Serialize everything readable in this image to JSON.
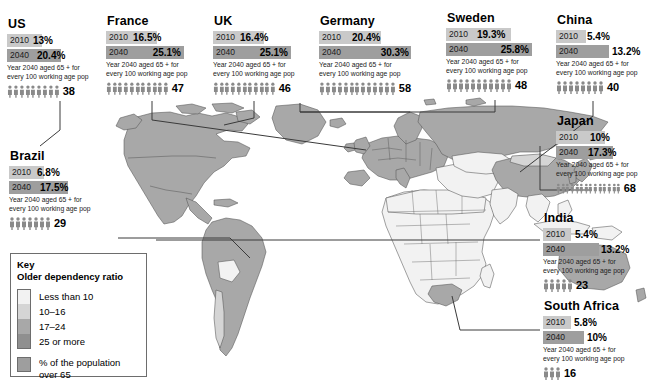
{
  "legend": {
    "title_line1": "Key",
    "title_line2": "Older dependency ratio",
    "scale": [
      {
        "label": "Less than 10",
        "color": "#f2f2f2"
      },
      {
        "label": "10–16",
        "color": "#d5d5d5"
      },
      {
        "label": "17–24",
        "color": "#a8a8a8"
      },
      {
        "label": "25 or more",
        "color": "#8f8f8f"
      }
    ],
    "population_swatch_label_line1": "% of the population",
    "population_swatch_label_line2": "over 65",
    "population_swatch_color": "#9e9e9e"
  },
  "note_line1": "Year 2040 aged 65 + for",
  "note_line2": "every 100 working age pop",
  "year_2010_label": "2010",
  "year_2040_label": "2040",
  "colors": {
    "bar_2010": "#c9c9c9",
    "bar_2040": "#9e9e9e",
    "map_light": "#f2f2f2",
    "map_mid": "#d5d5d5",
    "map_dark": "#a8a8a8",
    "outline": "#555555"
  },
  "countries": [
    {
      "id": "us",
      "name": "US",
      "v2010": "13%",
      "v2040": "20.4%",
      "bar2010_pct": 52,
      "bar2040_pct": 80,
      "dependency": "38",
      "icons": 9
    },
    {
      "id": "france",
      "name": "France",
      "v2010": "16.5%",
      "v2040": "25.1%",
      "bar2010_pct": 66,
      "bar2040_pct": 100,
      "dependency": "47",
      "icons": 11
    },
    {
      "id": "uk",
      "name": "UK",
      "v2010": "16.4%",
      "v2040": "25.1%",
      "bar2010_pct": 65,
      "bar2040_pct": 100,
      "dependency": "46",
      "icons": 11
    },
    {
      "id": "germany",
      "name": "Germany",
      "v2010": "20.4%",
      "v2040": "30.3%",
      "bar2010_pct": 67,
      "bar2040_pct": 100,
      "dependency": "58",
      "icons": 13
    },
    {
      "id": "sweden",
      "name": "Sweden",
      "v2010": "19.3%",
      "v2040": "25.8%",
      "bar2010_pct": 75,
      "bar2040_pct": 100,
      "dependency": "48",
      "icons": 11
    },
    {
      "id": "china",
      "name": "China",
      "v2010": "5.4%",
      "v2040": "13.2%",
      "bar2010_pct": 41,
      "bar2040_pct": 72,
      "dependency": "40",
      "icons": 8
    },
    {
      "id": "japan",
      "name": "Japan",
      "v2010": "10%",
      "v2040": "17.3%",
      "bar2010_pct": 61,
      "bar2040_pct": 71,
      "dependency": "68",
      "icons": 14
    },
    {
      "id": "india",
      "name": "India",
      "v2010": "5.4%",
      "v2040": "13.2%",
      "bar2010_pct": 36,
      "bar2040_pct": 72,
      "dependency": "23",
      "icons": 5
    },
    {
      "id": "brazil",
      "name": "Brazil",
      "v2010": "6.8%",
      "v2040": "17.5%",
      "bar2010_pct": 46,
      "bar2040_pct": 78,
      "dependency": "29",
      "icons": 7
    },
    {
      "id": "south-africa",
      "name": "South Africa",
      "v2010": "5.8%",
      "v2040": "10%",
      "bar2010_pct": 38,
      "bar2040_pct": 55,
      "dependency": "16",
      "icons": 3
    }
  ]
}
